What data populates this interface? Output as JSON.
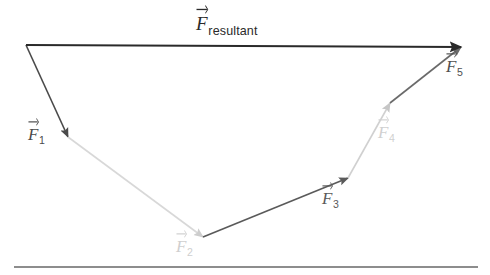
{
  "figure": {
    "background_color": "#ffffff",
    "baseline_rule_color": "#8d8d8d"
  },
  "labels": {
    "resultant": {
      "symbol": "F",
      "subscript": "resultant",
      "color": "#2a2a2a",
      "x": 196,
      "y": 14
    },
    "f1": {
      "symbol": "F",
      "subscript": "1",
      "color": "#4a4a4a",
      "x": 28,
      "y": 126
    },
    "f2": {
      "symbol": "F",
      "subscript": "2",
      "color": "#cfcfcf",
      "x": 176,
      "y": 238
    },
    "f3": {
      "symbol": "F",
      "subscript": "3",
      "color": "#5a5a5a",
      "x": 322,
      "y": 190
    },
    "f4": {
      "symbol": "F",
      "subscript": "4",
      "color": "#d0d0d0",
      "x": 378,
      "y": 124
    },
    "f5": {
      "symbol": "F",
      "subscript": "5",
      "color": "#4f4f4f",
      "x": 446,
      "y": 58
    }
  },
  "chart_data": {
    "type": "diagram",
    "xlabel": "",
    "ylabel": "",
    "xlim": [
      0,
      490
    ],
    "ylim": [
      0,
      275
    ],
    "grid": false,
    "legend": "none",
    "origin": {
      "x": 26,
      "y": 45
    },
    "vectors": [
      {
        "name": "F1",
        "label": "F_1",
        "color": "#4a4a4a",
        "width": 1.6,
        "start": {
          "x": 26,
          "y": 45
        },
        "end": {
          "x": 68,
          "y": 137
        },
        "dx": 42,
        "dy": 92,
        "magnitude": 101.1,
        "angle_deg": -65.5
      },
      {
        "name": "F2",
        "label": "F_2",
        "color": "#d8d8d8",
        "width": 1.6,
        "start": {
          "x": 68,
          "y": 137
        },
        "end": {
          "x": 203,
          "y": 237
        },
        "dx": 135,
        "dy": 100,
        "magnitude": 168.0,
        "angle_deg": -36.5
      },
      {
        "name": "F3",
        "label": "F_3",
        "color": "#5a5a5a",
        "width": 1.6,
        "start": {
          "x": 203,
          "y": 237
        },
        "end": {
          "x": 348,
          "y": 178
        },
        "dx": 145,
        "dy": -59,
        "magnitude": 156.5,
        "angle_deg": 22.1
      },
      {
        "name": "F4",
        "label": "F_4",
        "color": "#d0d0d0",
        "width": 1.6,
        "start": {
          "x": 348,
          "y": 178
        },
        "end": {
          "x": 390,
          "y": 103
        },
        "dx": 42,
        "dy": -75,
        "magnitude": 85.9,
        "angle_deg": 60.7
      },
      {
        "name": "F5",
        "label": "F_5",
        "color": "#6a6a6a",
        "width": 1.6,
        "start": {
          "x": 390,
          "y": 103
        },
        "end": {
          "x": 461,
          "y": 47
        },
        "dx": 71,
        "dy": -56,
        "magnitude": 90.4,
        "angle_deg": 38.3
      }
    ],
    "resultant": {
      "name": "F_resultant",
      "label": "F_resultant",
      "color": "#2a2a2a",
      "width": 2.0,
      "start": {
        "x": 26,
        "y": 45
      },
      "end": {
        "x": 461,
        "y": 47
      },
      "dx": 435,
      "dy": 2,
      "magnitude": 435.0,
      "angle_deg": -0.3
    },
    "baseline": {
      "x1": 14,
      "y1": 266,
      "x2": 478,
      "y2": 266,
      "color": "#8d8d8d"
    }
  }
}
